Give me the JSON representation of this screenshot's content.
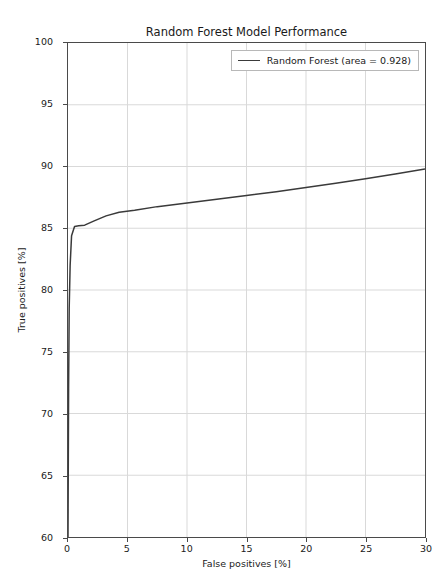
{
  "chart_data": {
    "type": "line",
    "title": "Random Forest Model Performance",
    "xlabel": "False positives [%]",
    "ylabel": "True positives [%]",
    "xlim": [
      0,
      30
    ],
    "ylim": [
      60,
      100
    ],
    "xticks": [
      0,
      5,
      10,
      15,
      20,
      25,
      30
    ],
    "yticks": [
      60,
      65,
      70,
      75,
      80,
      85,
      90,
      95,
      100
    ],
    "grid": true,
    "legend_position": "upper right",
    "series": [
      {
        "name": "Random Forest (area = 0.928)",
        "color": "#3a3a3a",
        "area": 0.928,
        "x": [
          0.0,
          0.05,
          0.1,
          0.18,
          0.3,
          0.55,
          0.9,
          1.4,
          2.2,
          3.2,
          4.3,
          5.6,
          7.5,
          10.0,
          12.5,
          15.0,
          17.5,
          20.0,
          22.5,
          25.0,
          27.5,
          30.0
        ],
        "y": [
          60.0,
          72.0,
          78.5,
          82.0,
          84.4,
          85.15,
          85.2,
          85.25,
          85.6,
          86.0,
          86.3,
          86.45,
          86.75,
          87.05,
          87.35,
          87.65,
          87.95,
          88.3,
          88.65,
          89.0,
          89.4,
          89.8
        ]
      }
    ]
  },
  "legend": {
    "entries": [
      {
        "label": "Random Forest (area = 0.928)",
        "swatch_name": "legend-line-swatch"
      }
    ]
  }
}
